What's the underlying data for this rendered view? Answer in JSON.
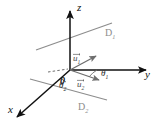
{
  "figure": {
    "background_color": "#ffffff",
    "axis_color": "#111111",
    "line_color": "#8d8d8d",
    "vector_color": "#6e6e6e",
    "dashed_color": "#6e6e6e"
  },
  "axes": {
    "z": {
      "label": "z",
      "arrow": "up"
    },
    "y": {
      "label": "y",
      "arrow": "right"
    },
    "x": {
      "label": "x",
      "arrow": "down-left"
    }
  },
  "origin": {
    "label": "0"
  },
  "lines": [
    {
      "name": "D1",
      "label": "D",
      "sub": "1"
    },
    {
      "name": "D2",
      "label": "D",
      "sub": "2"
    }
  ],
  "vectors": [
    {
      "name": "u1",
      "label": "u",
      "sub": "1",
      "overbar": true
    },
    {
      "name": "u2",
      "label": "u",
      "sub": "2",
      "overbar": true
    }
  ],
  "angles": [
    {
      "name": "theta1",
      "label": "θ",
      "sub": "1"
    },
    {
      "name": "theta2",
      "label": "θ",
      "sub": "2"
    }
  ]
}
